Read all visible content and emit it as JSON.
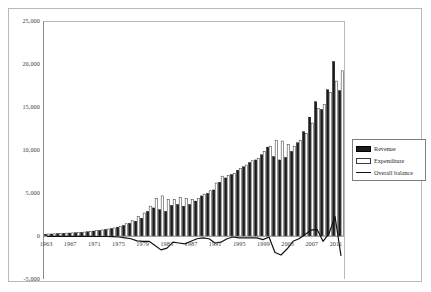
{
  "chart_data": {
    "type": "bar",
    "title": "",
    "subtitle": "",
    "xlabel": "",
    "ylabel": "",
    "ylim": [
      -5000,
      25000
    ],
    "yticks": [
      25000,
      20000,
      15000,
      10000,
      5000,
      0,
      -5000
    ],
    "ytick_labels": [
      "25,000",
      "20,000",
      "15,000",
      "10,000",
      "5,000",
      "0",
      "-5,000"
    ],
    "grid": false,
    "legend_position": "right",
    "legend": [
      "Revenue",
      "Expenditure",
      "Overall balance"
    ],
    "colors": {
      "revenue": "#1a1a1a",
      "expenditure": "#ffffff",
      "expenditure_edge": "#3a3a3a",
      "overall_balance": "#111111",
      "axis": "#8a8a8a",
      "frame": "#b9b9b9",
      "text": "#404040"
    },
    "categories": [
      1963,
      1964,
      1965,
      1966,
      1967,
      1968,
      1969,
      1970,
      1971,
      1972,
      1973,
      1974,
      1975,
      1976,
      1977,
      1978,
      1979,
      1980,
      1981,
      1982,
      1983,
      1984,
      1985,
      1986,
      1987,
      1988,
      1989,
      1990,
      1991,
      1992,
      1993,
      1994,
      1995,
      1996,
      1997,
      1998,
      1999,
      2000,
      2001,
      2002,
      2003,
      2004,
      2005,
      2006,
      2007,
      2008,
      2009,
      2010,
      2011,
      2012
    ],
    "xtick_labels": [
      "1963",
      "1967",
      "1971",
      "1975",
      "1979",
      "1983",
      "1987",
      "1991",
      "1995",
      "1999",
      "2003",
      "2007",
      "2011"
    ],
    "series": [
      {
        "name": "Revenue",
        "values": [
          230,
          260,
          300,
          330,
          370,
          400,
          450,
          520,
          600,
          680,
          790,
          900,
          1050,
          1250,
          1500,
          1750,
          2100,
          2900,
          3300,
          3100,
          2900,
          3600,
          3700,
          3500,
          3700,
          4100,
          4700,
          5000,
          5400,
          6300,
          6800,
          7200,
          7700,
          8100,
          8600,
          8900,
          9500,
          10400,
          9300,
          8900,
          9200,
          9900,
          10900,
          12200,
          13900,
          15700,
          14800,
          17100,
          20400,
          17000
        ]
      },
      {
        "name": "Expenditure",
        "values": [
          250,
          280,
          320,
          350,
          390,
          430,
          480,
          550,
          640,
          720,
          830,
          960,
          1150,
          1450,
          1800,
          2300,
          2700,
          3500,
          4400,
          4700,
          4300,
          4300,
          4500,
          4400,
          4300,
          4400,
          4900,
          5300,
          6200,
          7000,
          7100,
          7300,
          7900,
          8300,
          8800,
          9100,
          9900,
          10500,
          11200,
          11100,
          10700,
          10500,
          11200,
          12000,
          13200,
          14900,
          15400,
          16800,
          18100,
          19300
        ]
      }
    ],
    "line_series": {
      "name": "Overall balance",
      "values": [
        -20,
        -20,
        -20,
        -20,
        -20,
        -30,
        -30,
        -30,
        -40,
        -40,
        -40,
        -60,
        -100,
        -200,
        -300,
        -550,
        -600,
        -600,
        -1100,
        -1600,
        -1400,
        -700,
        -800,
        -900,
        -600,
        -300,
        -200,
        -300,
        -800,
        -700,
        -300,
        -100,
        -200,
        -200,
        -200,
        -200,
        -400,
        -100,
        -1900,
        -2200,
        -1500,
        -600,
        -300,
        200,
        700,
        800,
        -600,
        300,
        2300,
        -2300
      ]
    }
  },
  "legend": {
    "items": [
      {
        "label": "Revenue",
        "swatch": "filled-dark-rect"
      },
      {
        "label": "Expenditure",
        "swatch": "outlined-white-rect"
      },
      {
        "label": "Overall balance",
        "swatch": "line-segment"
      }
    ]
  }
}
